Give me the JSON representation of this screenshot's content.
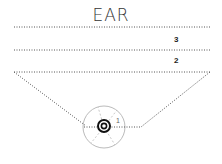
{
  "title": "EAR",
  "levels": [
    {
      "label": "3"
    },
    {
      "label": "2"
    },
    {
      "label": "1"
    }
  ],
  "colors": {
    "line": "#555555",
    "circle": "#bbbbbb",
    "target": "#111111"
  }
}
